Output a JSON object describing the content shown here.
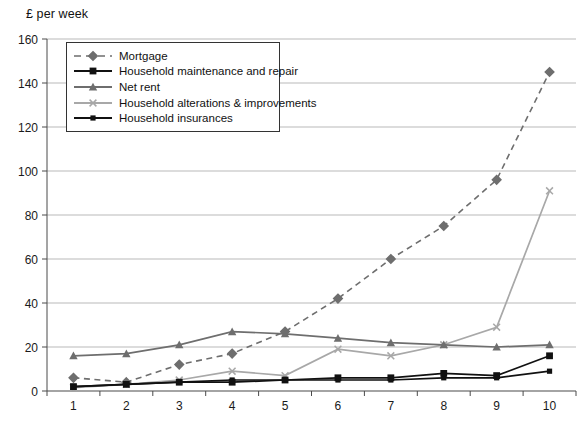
{
  "chart_data": {
    "type": "line",
    "title": "",
    "ylabel": "£ per week",
    "xlabel": "",
    "categories": [
      "1",
      "2",
      "3",
      "4",
      "5",
      "6",
      "7",
      "8",
      "9",
      "10"
    ],
    "ylim": [
      0,
      160
    ],
    "yticks": [
      0,
      20,
      40,
      60,
      80,
      100,
      120,
      140,
      160
    ],
    "grid": "horizontal",
    "legend_position": "top-left-inside",
    "series": [
      {
        "name": "Mortgage",
        "values": [
          6,
          4,
          12,
          17,
          27,
          42,
          60,
          75,
          96,
          145
        ],
        "color": "#6e6e6e",
        "dash": "dashed",
        "marker": "diamond"
      },
      {
        "name": "Household maintenance and repair",
        "values": [
          2,
          3,
          4,
          4,
          5,
          6,
          6,
          8,
          7,
          16
        ],
        "color": "#111111",
        "dash": "solid",
        "marker": "square"
      },
      {
        "name": "Net rent",
        "values": [
          16,
          17,
          21,
          27,
          26,
          24,
          22,
          21,
          20,
          21
        ],
        "color": "#6e6e6e",
        "dash": "solid",
        "marker": "triangle"
      },
      {
        "name": "Household alterations & improvements",
        "values": [
          1.5,
          3,
          5,
          9,
          7,
          19,
          16,
          21,
          29,
          91
        ],
        "color": "#a8a8a8",
        "dash": "solid",
        "marker": "cross"
      },
      {
        "name": "Household insurances",
        "values": [
          2,
          3,
          4,
          5,
          5,
          5,
          5,
          6,
          6,
          9
        ],
        "color": "#111111",
        "dash": "solid",
        "marker": "square-small"
      }
    ]
  },
  "axis": {
    "y_title": "£ per week"
  },
  "legend": {
    "items": [
      {
        "label": "Mortgage"
      },
      {
        "label": "Household maintenance and repair"
      },
      {
        "label": "Net rent"
      },
      {
        "label": "Household alterations & improvements"
      },
      {
        "label": "Household insurances"
      }
    ]
  }
}
